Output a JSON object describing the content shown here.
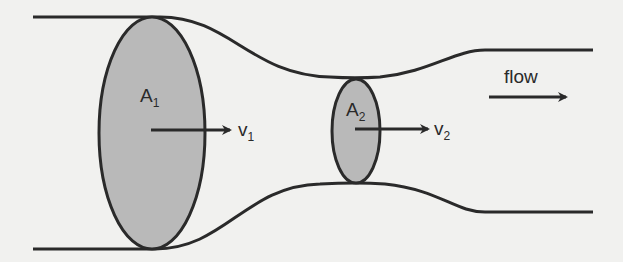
{
  "diagram": {
    "colors": {
      "background": "#f1f1ef",
      "stroke": "#2a2a2a",
      "cross_section_fill": "#b9b9b9"
    },
    "sections": [
      {
        "area_label": "A",
        "area_subscript": "1",
        "velocity_label": "v",
        "velocity_subscript": "1"
      },
      {
        "area_label": "A",
        "area_subscript": "2",
        "velocity_label": "v",
        "velocity_subscript": "2"
      }
    ],
    "flow_label": "flow"
  }
}
